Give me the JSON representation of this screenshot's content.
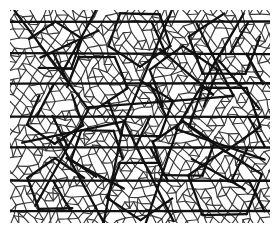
{
  "figure": {
    "kind": "quasiperiodic-pentagonal-tiling",
    "caption": "",
    "canvas": {
      "width": 277,
      "height": 234,
      "background_color": "#ffffff"
    },
    "plot_area": {
      "x": 10,
      "y": 10,
      "width": 260,
      "height": 213
    },
    "layers": [
      {
        "name": "fine-network",
        "description": "dense thin-line net of pentagons, hexagons and rhombi",
        "stroke_color": "#3a3a3a",
        "stroke_width": 1.15,
        "edge_length": 9.1
      },
      {
        "name": "coarse-network",
        "description": "superimposed thick-line inflated tiling of large pentagons, triangles and rhombi",
        "stroke_color": "#101010",
        "stroke_width": 2.3,
        "edge_length": 47.2
      }
    ],
    "symmetry": {
      "order": 5,
      "angles_deg": [
        0,
        36,
        72,
        108,
        144
      ]
    }
  },
  "chart_data": {
    "type": "diagram",
    "title": "",
    "subtitle": "",
    "xlabel": "",
    "ylabel": "",
    "legend": [],
    "annotations": [],
    "grid": false
  }
}
